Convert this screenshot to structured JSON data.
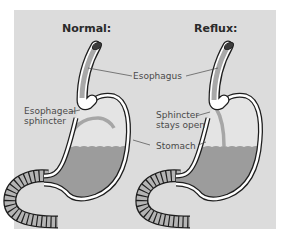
{
  "diagram": {
    "panels": [
      {
        "title": "Normal:"
      },
      {
        "title": "Reflux:"
      }
    ],
    "labels": {
      "esophagus": "Esophagus",
      "esophageal_sphincter_line1": "Esophageal",
      "esophageal_sphincter_line2": "sphincter",
      "sphincter_open_line1": "Sphincter",
      "sphincter_open_line2": "stays open",
      "stomach": "Stomach"
    },
    "colors": {
      "background": "#dcdcdc",
      "stomach_fill": "#e4e4e4",
      "fluid": "#9c9c9c",
      "esophagus_fill": "#a8a8a8",
      "outline": "#1e1e1e",
      "wall": "#ffffff",
      "intestine": "#b4b4b4"
    }
  }
}
